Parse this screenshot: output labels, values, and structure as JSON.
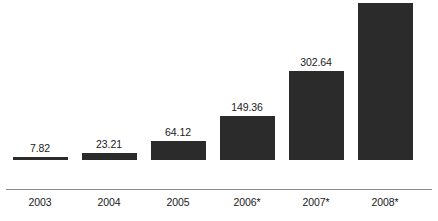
{
  "chart_data": {
    "type": "bar",
    "title": "",
    "subtitle": "",
    "xlabel": "",
    "ylabel": "",
    "categories": [
      "2003",
      "2004",
      "2005",
      "2006*",
      "2007*",
      "2008*"
    ],
    "values": [
      7.82,
      23.21,
      64.12,
      149.36,
      302.64,
      531.43
    ],
    "value_labels": [
      "7.82",
      "23.21",
      "64.12",
      "149.36",
      "302.64",
      "531.43"
    ],
    "series": [
      {
        "name": "",
        "values": [
          7.82,
          23.21,
          64.12,
          149.36,
          302.64,
          531.43
        ]
      }
    ],
    "ylim": [
      0,
      531.43
    ],
    "grid": false,
    "legend": false,
    "legend_position": "none",
    "annotations": [],
    "bar_color": "#2b2b2b",
    "axis_color": "#8a8a8a",
    "background_color": "#ffffff",
    "label_color": "#1a1a1a"
  }
}
